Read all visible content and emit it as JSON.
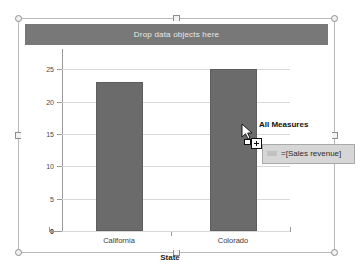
{
  "drop_zone": {
    "label": "Drop data objects here"
  },
  "chart_data": {
    "type": "bar",
    "title": "",
    "categories": [
      "California",
      "Colorado"
    ],
    "values": [
      23,
      25
    ],
    "series": [
      {
        "name": "Sales revenue",
        "values": [
          23,
          25
        ]
      }
    ],
    "xlabel": "State",
    "ylabel": "",
    "ylim": [
      0,
      27.5
    ],
    "yticks": [
      0,
      5,
      10,
      15,
      20,
      25
    ],
    "ytick_labels": [
      "0",
      "5",
      "10",
      "15",
      "20",
      "25"
    ],
    "grid": true,
    "legend": false,
    "bar_color": "#6b6b6b"
  },
  "drag": {
    "measures_label": "All Measures",
    "formula": "=[Sales revenue]",
    "cursor_icon": "arrow-cursor-icon",
    "plus_icon": "drag-plus-icon"
  },
  "colors": {
    "band": "#787878",
    "bar": "#6b6b6b",
    "grid": "#d8d8d8",
    "axis": "#9a9a9a",
    "tooltip_bg": "#d6d6d6"
  }
}
